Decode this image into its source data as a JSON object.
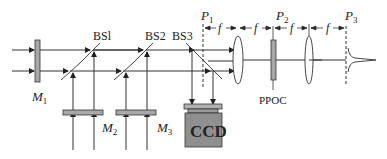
{
  "diagram": {
    "type": "optical-setup",
    "labels": {
      "m1": "M",
      "m1_sub": "1",
      "m2": "M",
      "m2_sub": "2",
      "m3": "M",
      "m3_sub": "3",
      "bs1": "BSl",
      "bs2": "BS2",
      "bs3": "BS3",
      "p1": "P",
      "p1_sub": "1",
      "p2": "P",
      "p2_sub": "2",
      "p3": "P",
      "p3_sub": "3",
      "f1": "f",
      "f2": "f",
      "f3": "f",
      "f4": "f",
      "ppoc": "PPOC",
      "ccd": "CCD"
    },
    "colors": {
      "line": "#333333",
      "component_fill": "#a8a8a8",
      "ccd_fill": "#8f8f8f",
      "ccd_top_fill": "#b0b0b0"
    }
  }
}
